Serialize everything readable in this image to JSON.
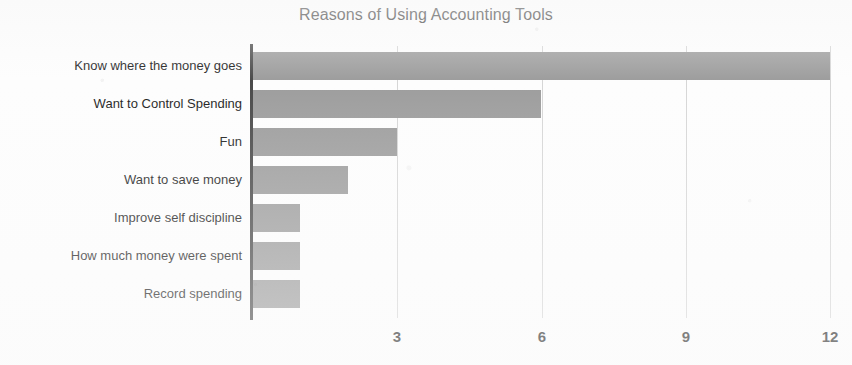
{
  "chart_data": {
    "type": "bar",
    "orientation": "horizontal",
    "title": "Reasons of Using Accounting Tools",
    "xlabel": "",
    "ylabel": "",
    "categories": [
      "Know where the money goes",
      "Want to Control Spending",
      "Fun",
      "Want to save money",
      "Improve self discipline",
      "How much money were spent",
      "Record spending"
    ],
    "values": [
      12,
      6,
      3,
      2,
      1,
      1,
      1
    ],
    "xlim": [
      0,
      12
    ],
    "xticks": [
      3,
      6,
      9,
      12
    ],
    "xtick_labels": [
      "3",
      "6",
      "9",
      "12"
    ],
    "grid": "vertical-only",
    "legend": "none",
    "bar_color": "#9d9d9d",
    "axis_color": "#4a4a4a",
    "gridline_color": "#d6d6d6",
    "background_color": "#fdfdfd",
    "text_color": "#1d1d1d"
  }
}
